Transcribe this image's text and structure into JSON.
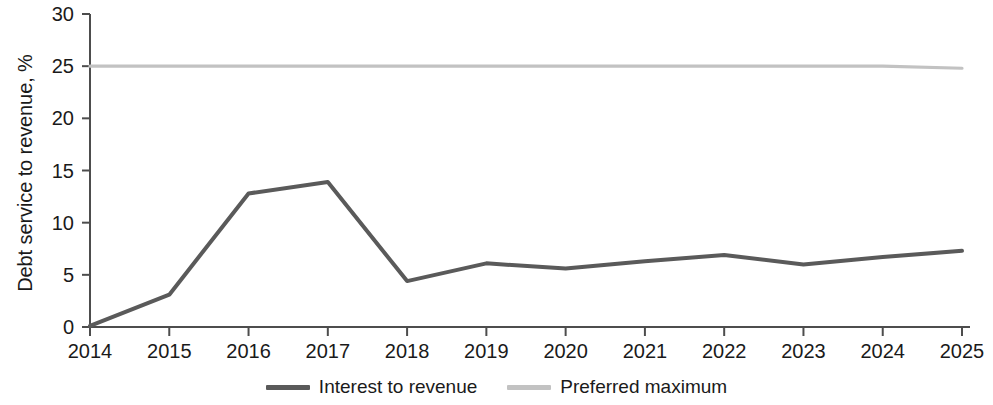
{
  "chart_data": {
    "type": "line",
    "title": "",
    "xlabel": "",
    "ylabel": "Debt service to revenue, %",
    "categories": [
      "2014",
      "2015",
      "2016",
      "2017",
      "2018",
      "2019",
      "2020",
      "2021",
      "2022",
      "2023",
      "2024",
      "2025"
    ],
    "xticklabels": [
      "2014",
      "2015",
      "2016",
      "2017",
      "2018",
      "2019",
      "2020",
      "2021",
      "2022",
      "2023",
      "2024",
      "2025"
    ],
    "yticklabels": [
      "0",
      "5",
      "10",
      "15",
      "20",
      "25",
      "30"
    ],
    "yticks": [
      0,
      5,
      10,
      15,
      20,
      25,
      30
    ],
    "ylim": [
      0,
      30
    ],
    "grid": false,
    "legend_position": "bottom-center",
    "series": [
      {
        "name": "Interest to revenue",
        "color": "#5a5a5a",
        "values": [
          0.1,
          3.1,
          12.8,
          13.9,
          4.4,
          6.1,
          5.6,
          6.3,
          6.9,
          6.0,
          6.7,
          7.3
        ]
      },
      {
        "name": "Preferred maximum",
        "color": "#c2c2c2",
        "values": [
          25.0,
          25.0,
          25.0,
          25.0,
          25.0,
          25.0,
          25.0,
          25.0,
          25.0,
          25.0,
          25.0,
          24.8
        ]
      }
    ]
  },
  "legend": {
    "items": [
      {
        "label": "Interest to revenue",
        "color": "#5a5a5a"
      },
      {
        "label": "Preferred maximum",
        "color": "#c2c2c2"
      }
    ]
  },
  "axis": {
    "color": "#4d4d4d"
  }
}
